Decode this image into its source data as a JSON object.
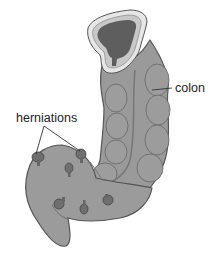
{
  "figure": {
    "type": "anatomical-illustration",
    "labels": {
      "colon": "colon",
      "herniations": "herniations"
    },
    "colors": {
      "background": "#ffffff",
      "tissue": "#9a9a9a",
      "tissue_dark": "#7a7a7a",
      "tissue_outline": "#555555",
      "lumen_dark": "#5e5e5e",
      "mucosa_light": "#c8c8c8",
      "mucosa_ring": "#e6e6e6",
      "label_text": "#222222",
      "leader_line": "#333333"
    },
    "herniation_count": 7
  }
}
